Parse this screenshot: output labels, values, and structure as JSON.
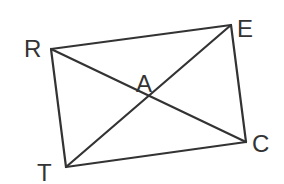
{
  "diagram": {
    "type": "quadrilateral-with-diagonals",
    "colors": {
      "background": "#ffffff",
      "stroke": "#333333",
      "text": "#333333"
    },
    "vertices": [
      {
        "id": "R",
        "label": "R",
        "x": 51,
        "y": 49
      },
      {
        "id": "E",
        "label": "E",
        "x": 231,
        "y": 25
      },
      {
        "id": "C",
        "label": "C",
        "x": 246,
        "y": 142
      },
      {
        "id": "T",
        "label": "T",
        "x": 66,
        "y": 167
      }
    ],
    "intersection": {
      "id": "A",
      "label": "A",
      "x": 148,
      "y": 96
    },
    "sides": [
      {
        "from": "R",
        "to": "E"
      },
      {
        "from": "E",
        "to": "C"
      },
      {
        "from": "C",
        "to": "T"
      },
      {
        "from": "T",
        "to": "R"
      }
    ],
    "diagonals": [
      {
        "from": "R",
        "to": "C"
      },
      {
        "from": "T",
        "to": "E"
      }
    ],
    "labels": {
      "R": "R",
      "E": "E",
      "C": "C",
      "T": "T",
      "A": "A"
    }
  }
}
